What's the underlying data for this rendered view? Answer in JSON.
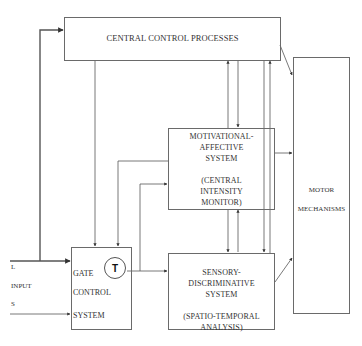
{
  "diagram": {
    "central_control": {
      "label": "CENTRAL CONTROL PROCESSES"
    },
    "motivational": {
      "line1": "MOTIVATIONAL-",
      "line2": "AFFECTIVE",
      "line3": "SYSTEM",
      "line4": "(CENTRAL",
      "line5": "INTENSITY",
      "line6": "MONITOR)"
    },
    "sensory": {
      "line1": "SENSORY-",
      "line2": "DISCRIMINATIVE",
      "line3": "SYSTEM",
      "line4": "(SPATIO-TEMPORAL",
      "line5": "ANALYSIS)"
    },
    "gate": {
      "line1": "GATE",
      "line2": "CONTROL",
      "line3": "SYSTEM",
      "transmission_symbol": "T"
    },
    "motor": {
      "line1": "MOTOR",
      "line2": "MECHANISMS"
    },
    "input": {
      "large_fiber": "L",
      "label": "INPUT",
      "small_fiber": "S"
    },
    "colors": {
      "line": "#555555",
      "box_border": "#6a6a6a",
      "text": "#333333",
      "background": "#ffffff"
    }
  }
}
